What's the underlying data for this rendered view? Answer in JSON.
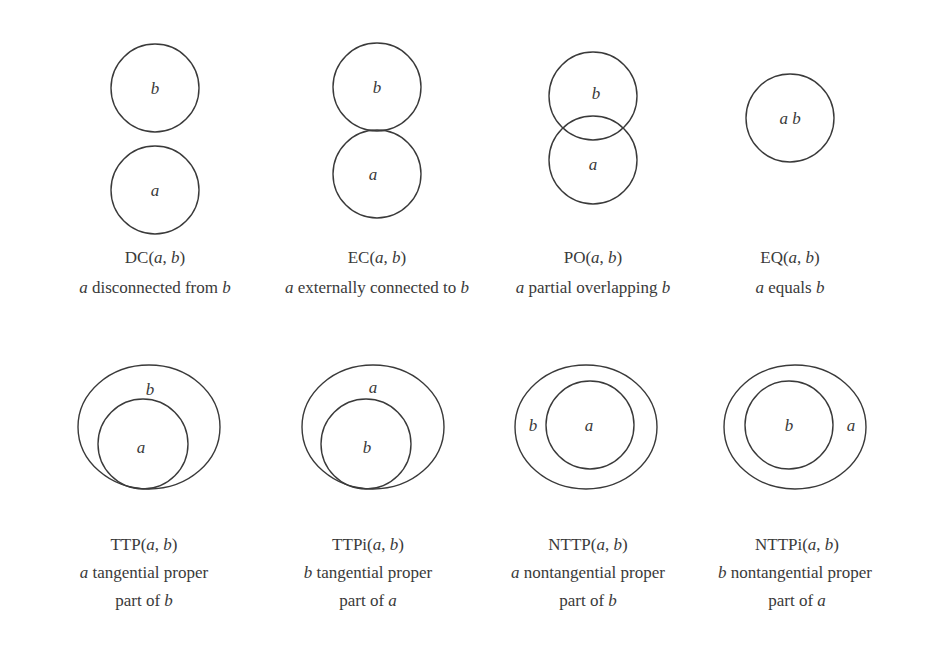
{
  "colors": {
    "stroke": "#3a3a3a",
    "text": "#3a3a3a",
    "background": "#ffffff"
  },
  "relations": [
    {
      "id": "DC",
      "name_prefix": "DC(",
      "arg1": "a",
      "sep": ", ",
      "arg2": "b",
      "name_suffix": ")",
      "desc_lines": [
        {
          "pre_it": "a",
          "text": " disconnected from ",
          "post_it": "b"
        }
      ],
      "labels": {
        "a": "a",
        "b": "b"
      }
    },
    {
      "id": "EC",
      "name_prefix": "EC(",
      "arg1": "a",
      "sep": ", ",
      "arg2": "b",
      "name_suffix": ")",
      "desc_lines": [
        {
          "pre_it": "a",
          "text": " externally connected to ",
          "post_it": "b"
        }
      ],
      "labels": {
        "a": "a",
        "b": "b"
      }
    },
    {
      "id": "PO",
      "name_prefix": "PO(",
      "arg1": "a",
      "sep": ", ",
      "arg2": "b",
      "name_suffix": ")",
      "desc_lines": [
        {
          "pre_it": "a",
          "text": " partial overlapping ",
          "post_it": "b"
        }
      ],
      "labels": {
        "a": "a",
        "b": "b"
      }
    },
    {
      "id": "EQ",
      "name_prefix": "EQ(",
      "arg1": "a",
      "sep": ", ",
      "arg2": "b",
      "name_suffix": ")",
      "desc_lines": [
        {
          "pre_it": "a",
          "text": " equals ",
          "post_it": "b"
        }
      ],
      "labels": {
        "ab": "a b"
      }
    },
    {
      "id": "TTP",
      "name_prefix": "TTP(",
      "arg1": "a",
      "sep": ", ",
      "arg2": "b",
      "name_suffix": ")",
      "desc_lines": [
        {
          "pre_it": "a",
          "text": " tangential proper",
          "post_it": ""
        },
        {
          "pre_it": "",
          "text": "part of ",
          "post_it": "b"
        }
      ],
      "labels": {
        "a": "a",
        "b": "b"
      }
    },
    {
      "id": "TTPi",
      "name_prefix": "TTPi(",
      "arg1": "a",
      "sep": ", ",
      "arg2": "b",
      "name_suffix": ")",
      "desc_lines": [
        {
          "pre_it": "b",
          "text": " tangential proper",
          "post_it": ""
        },
        {
          "pre_it": "",
          "text": "part of ",
          "post_it": "a"
        }
      ],
      "labels": {
        "a": "a",
        "b": "b"
      }
    },
    {
      "id": "NTTP",
      "name_prefix": "NTTP(",
      "arg1": "a",
      "sep": ", ",
      "arg2": "b",
      "name_suffix": ")",
      "desc_lines": [
        {
          "pre_it": "a",
          "text": " nontangential proper",
          "post_it": ""
        },
        {
          "pre_it": "",
          "text": "part of ",
          "post_it": "b"
        }
      ],
      "labels": {
        "a": "a",
        "b": "b"
      }
    },
    {
      "id": "NTTPi",
      "name_prefix": "NTTPi(",
      "arg1": "a",
      "sep": ", ",
      "arg2": "b",
      "name_suffix": ")",
      "desc_lines": [
        {
          "pre_it": "b",
          "text": " nontangential proper",
          "post_it": ""
        },
        {
          "pre_it": "",
          "text": "part of ",
          "post_it": "a"
        }
      ],
      "labels": {
        "a": "a",
        "b": "b"
      }
    }
  ]
}
